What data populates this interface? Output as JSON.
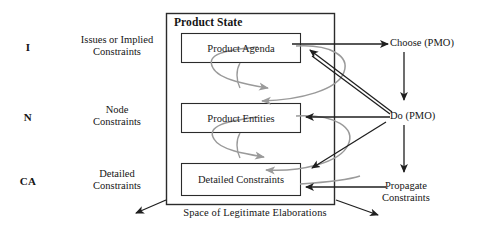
{
  "diagram": {
    "title": "Product State",
    "tiers": [
      {
        "code": "I",
        "desc": "Issues or Implied\nConstraints"
      },
      {
        "code": "N",
        "desc": "Node\nConstraints"
      },
      {
        "code": "CA",
        "desc": "Detailed\nConstraints"
      }
    ],
    "state_boxes": [
      {
        "label": "Product Agenda"
      },
      {
        "label": "Product Entities"
      },
      {
        "label": "Detailed Constraints"
      }
    ],
    "operations": [
      {
        "label": "Choose (PMO)"
      },
      {
        "label": "Do (PMO)"
      },
      {
        "label": "Propagate\nConstraints"
      }
    ],
    "footer": {
      "label": "Space of Legitimate Elaborations"
    },
    "colors": {
      "line": "#2b2b2b",
      "curve": "#8d8d8d",
      "text": "#151515",
      "background": "#ffffff"
    }
  }
}
